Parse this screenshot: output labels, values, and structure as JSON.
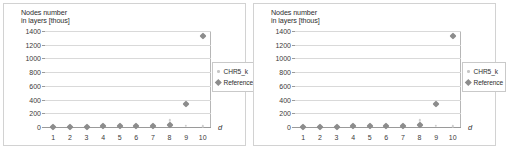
{
  "figure": {
    "panels": [
      {
        "id": "left-chart"
      },
      {
        "id": "right-chart"
      }
    ]
  },
  "chart_data": [
    {
      "type": "scatter",
      "title": "Nodes number\nin layers [thous]",
      "xlabel": "d",
      "ylabel": "Nodes number in layers [thous]",
      "xlim": [
        0.5,
        10.5
      ],
      "ylim": [
        0,
        1400
      ],
      "grid": true,
      "x_ticks": [
        1,
        2,
        3,
        4,
        5,
        6,
        7,
        8,
        9,
        10
      ],
      "y_ticks": [
        0,
        200,
        400,
        600,
        800,
        1000,
        1200,
        1400
      ],
      "legend_position": "right",
      "x": [
        1,
        2,
        3,
        4,
        5,
        6,
        7,
        8,
        9,
        10
      ],
      "series": [
        {
          "name": "CHR5_k",
          "marker": "small-dot",
          "color": "#cfcfcf",
          "values": [
            2,
            3,
            4,
            6,
            8,
            10,
            14,
            95,
            20,
            12
          ]
        },
        {
          "name": "Reference",
          "marker": "diamond",
          "color": "#8c8c8c",
          "values": [
            4,
            5,
            7,
            9,
            11,
            14,
            18,
            30,
            340,
            1330
          ]
        }
      ]
    },
    {
      "type": "scatter",
      "title": "Nodes number\nin layers [thous]",
      "xlabel": "d",
      "ylabel": "Nodes number in layers [thous]",
      "xlim": [
        0.5,
        10.5
      ],
      "ylim": [
        0,
        1400
      ],
      "grid": true,
      "x_ticks": [
        1,
        2,
        3,
        4,
        5,
        6,
        7,
        8,
        9,
        10
      ],
      "y_ticks": [
        0,
        200,
        400,
        600,
        800,
        1000,
        1200,
        1400
      ],
      "legend_position": "right",
      "x": [
        1,
        2,
        3,
        4,
        5,
        6,
        7,
        8,
        9,
        10
      ],
      "series": [
        {
          "name": "CHR5_k",
          "marker": "small-dot",
          "color": "#cfcfcf",
          "values": [
            2,
            3,
            4,
            6,
            8,
            10,
            14,
            95,
            20,
            12
          ]
        },
        {
          "name": "Reference",
          "marker": "diamond",
          "color": "#8c8c8c",
          "values": [
            4,
            5,
            7,
            9,
            11,
            14,
            18,
            30,
            340,
            1330
          ]
        }
      ]
    }
  ]
}
